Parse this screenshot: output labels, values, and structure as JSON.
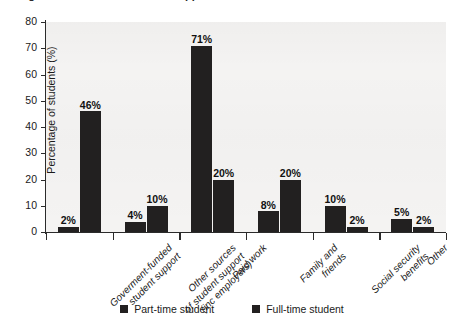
{
  "figure": {
    "top_cutoff_text": "Figure: Sources of financial support",
    "background_color": "#ffffff",
    "plot_background_color": "#f4f3f2",
    "bar_color": "#222020",
    "axis_color": "#2b2b2b"
  },
  "chart_data": {
    "type": "bar",
    "title": "",
    "xlabel": "",
    "ylabel": "Percentage of students (%)",
    "ylim": [
      0,
      80
    ],
    "yticks": [
      0,
      10,
      20,
      30,
      40,
      50,
      60,
      70,
      80
    ],
    "ytick_labels": [
      "0",
      "10",
      "20",
      "30",
      "40",
      "50",
      "60",
      "70",
      "80"
    ],
    "grid": false,
    "legend_position": "bottom-center",
    "categories": [
      "Goverment-funded student support",
      "Other sources of student support (inc employers)",
      "Paid work",
      "Family and friends",
      "Social security benefits",
      "Other"
    ],
    "category_lines": [
      [
        "Goverment-funded",
        "student support"
      ],
      [
        "Other sources",
        "of student support",
        "(inc employers)"
      ],
      [
        "Paid work"
      ],
      [
        "Family and",
        "friends"
      ],
      [
        "Social security",
        "benefits"
      ],
      [
        "Other"
      ]
    ],
    "series": [
      {
        "name": "Part-time student",
        "color": "#222020",
        "values": [
          2,
          4,
          71,
          8,
          10,
          5
        ],
        "data_labels": [
          "2%",
          "4%",
          "71%",
          "8%",
          "10%",
          "5%"
        ]
      },
      {
        "name": "Full-time student",
        "color": "#222020",
        "values": [
          46,
          10,
          20,
          20,
          2,
          2
        ],
        "data_labels": [
          "46%",
          "10%",
          "20%",
          "20%",
          "2%",
          "2%"
        ]
      }
    ]
  },
  "legend": {
    "items": [
      {
        "label": "Part-time student",
        "color": "#222020"
      },
      {
        "label": "Full-time student",
        "color": "#222020"
      }
    ]
  }
}
